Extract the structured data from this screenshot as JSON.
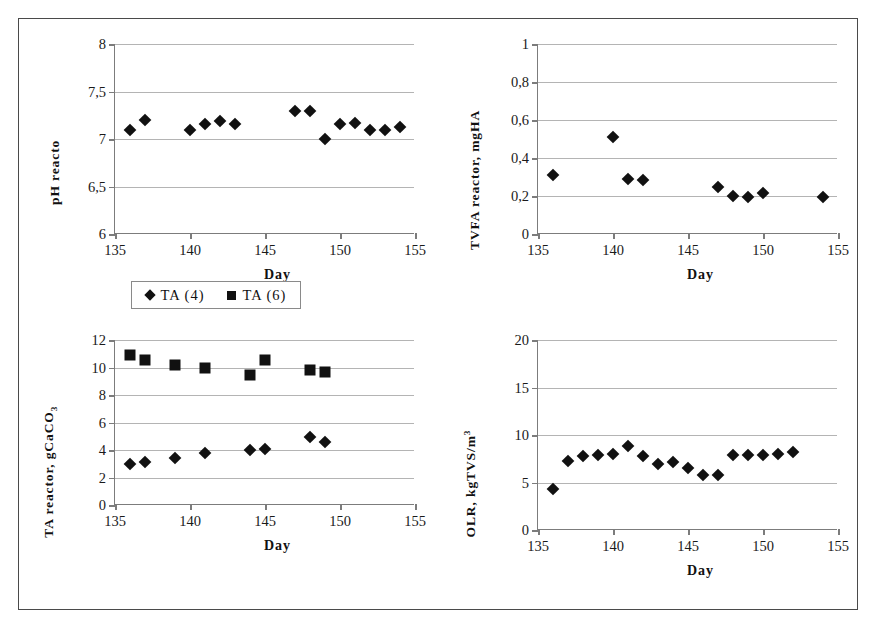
{
  "figure": {
    "axis_title_x": "Day",
    "legend": {
      "entries": [
        {
          "label": "TA (4)",
          "marker": "diamond"
        },
        {
          "label": "TA (6)",
          "marker": "square"
        }
      ]
    }
  },
  "chart_data": [
    {
      "id": "ph-reactor",
      "type": "scatter",
      "title": "",
      "ylabel": "pH reacto",
      "xlabel": "Day",
      "xlim": [
        135,
        155
      ],
      "ylim": [
        6,
        8
      ],
      "xticks": [
        135,
        140,
        145,
        150,
        155
      ],
      "xtick_labels": [
        "135",
        "140",
        "145",
        "150",
        "155"
      ],
      "yticks": [
        6,
        6.5,
        7,
        7.5,
        8
      ],
      "ytick_labels": [
        "6",
        "6,5",
        "7",
        "7,5",
        "8"
      ],
      "grid": true,
      "legend_position": "none",
      "series": [
        {
          "name": "pH reactor",
          "marker": "diamond",
          "x": [
            136,
            137,
            140,
            141,
            142,
            143,
            147,
            148,
            149,
            150,
            151,
            152,
            153,
            154
          ],
          "y": [
            7.1,
            7.2,
            7.1,
            7.16,
            7.19,
            7.16,
            7.29,
            7.3,
            7.0,
            7.16,
            7.17,
            7.1,
            7.1,
            7.13
          ]
        }
      ]
    },
    {
      "id": "tvfa-reactor",
      "type": "scatter",
      "title": "",
      "ylabel": "TVFA reactor, mgHA",
      "xlabel": "Day",
      "xlim": [
        135,
        155
      ],
      "ylim": [
        0,
        1
      ],
      "xticks": [
        135,
        140,
        145,
        150,
        155
      ],
      "xtick_labels": [
        "135",
        "140",
        "145",
        "150",
        "155"
      ],
      "yticks": [
        0,
        0.2,
        0.4,
        0.6,
        0.8,
        1
      ],
      "ytick_labels": [
        "0",
        "0,2",
        "0,4",
        "0,6",
        "0,8",
        "1"
      ],
      "grid": true,
      "legend_position": "none",
      "series": [
        {
          "name": "TVFA reactor",
          "marker": "diamond",
          "x": [
            136,
            140,
            141,
            142,
            147,
            148,
            149,
            150,
            154
          ],
          "y": [
            0.31,
            0.51,
            0.29,
            0.285,
            0.25,
            0.2,
            0.195,
            0.215,
            0.195
          ]
        }
      ]
    },
    {
      "id": "ta-reactor",
      "type": "scatter",
      "title": "",
      "ylabel": "TA reactor, gCaCO",
      "ylabel_sub": "3",
      "xlabel": "Day",
      "xlim": [
        135,
        155
      ],
      "ylim": [
        0,
        12
      ],
      "xticks": [
        135,
        140,
        145,
        150,
        155
      ],
      "xtick_labels": [
        "135",
        "140",
        "145",
        "150",
        "155"
      ],
      "yticks": [
        0,
        2,
        4,
        6,
        8,
        10,
        12
      ],
      "ytick_labels": [
        "0",
        "2",
        "4",
        "6",
        "8",
        "10",
        "12"
      ],
      "grid": true,
      "legend_position": "below",
      "series": [
        {
          "name": "TA (4)",
          "marker": "diamond",
          "x": [
            136,
            137,
            139,
            141,
            144,
            145,
            148,
            149
          ],
          "y": [
            3.0,
            3.1,
            3.45,
            3.8,
            4.0,
            4.1,
            4.95,
            4.55
          ]
        },
        {
          "name": "TA (6)",
          "marker": "square",
          "x": [
            136,
            137,
            139,
            141,
            144,
            145,
            148,
            149
          ],
          "y": [
            10.9,
            10.55,
            10.2,
            10.0,
            9.45,
            10.55,
            9.8,
            9.7
          ]
        }
      ]
    },
    {
      "id": "olr",
      "type": "scatter",
      "title": "",
      "ylabel": "OLR, kgTVS/m",
      "ylabel_sup": "3",
      "xlabel": "Day",
      "xlim": [
        135,
        155
      ],
      "ylim": [
        0,
        20
      ],
      "xticks": [
        135,
        140,
        145,
        150,
        155
      ],
      "xtick_labels": [
        "135",
        "140",
        "145",
        "150",
        "155"
      ],
      "yticks": [
        0,
        5,
        10,
        15,
        20
      ],
      "ytick_labels": [
        "0",
        "5",
        "10",
        "15",
        "20"
      ],
      "grid": true,
      "legend_position": "none",
      "series": [
        {
          "name": "OLR",
          "marker": "diamond",
          "x": [
            136,
            137,
            138,
            139,
            140,
            141,
            142,
            143,
            144,
            145,
            146,
            147,
            148,
            149,
            150,
            151,
            152
          ],
          "y": [
            4.3,
            7.3,
            7.8,
            7.85,
            8.0,
            8.8,
            7.75,
            7.0,
            7.15,
            6.55,
            5.8,
            5.8,
            7.85,
            7.85,
            7.85,
            8.0,
            8.25
          ]
        }
      ]
    }
  ]
}
